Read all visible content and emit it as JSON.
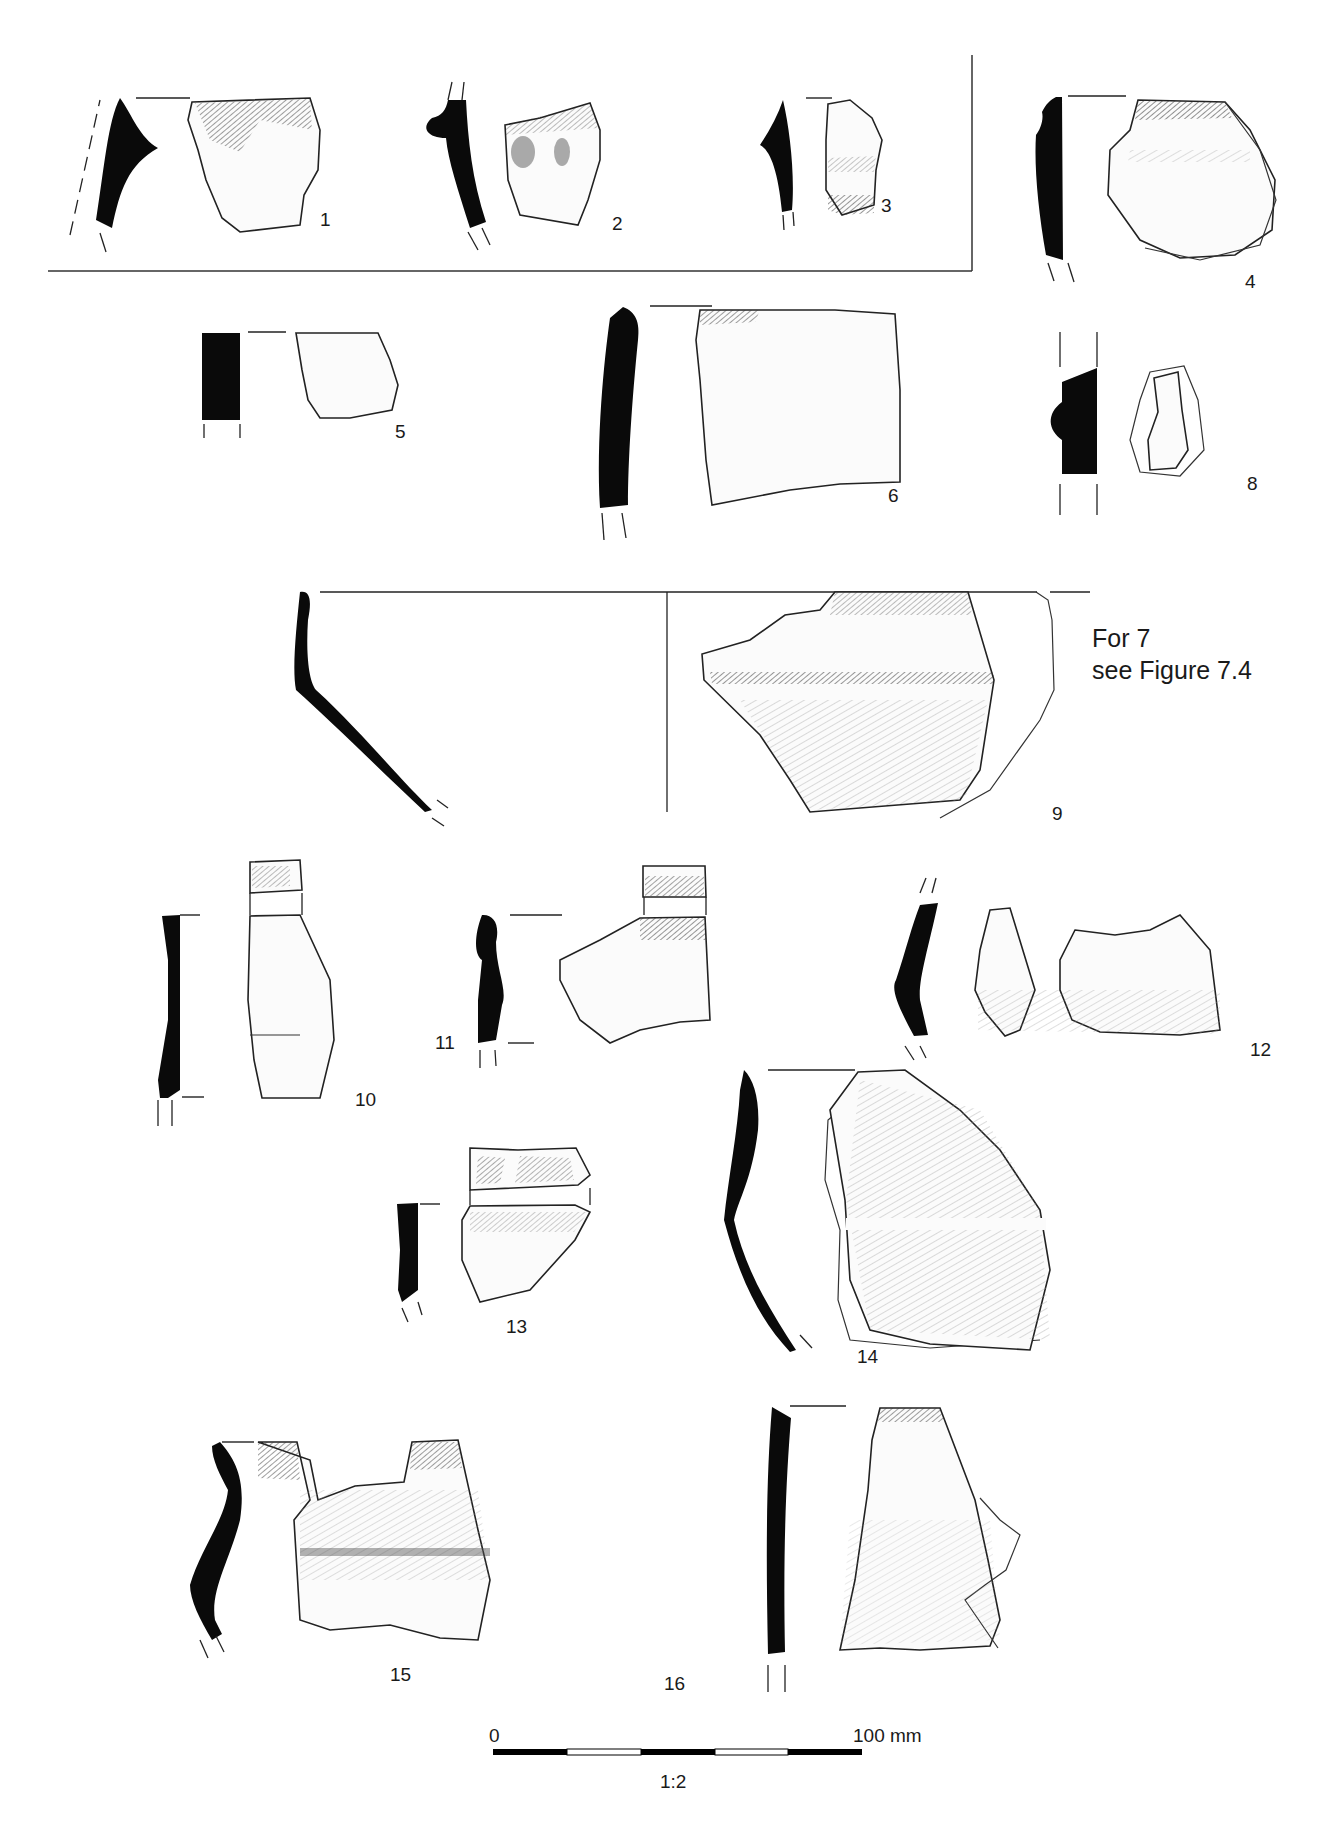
{
  "figure": {
    "type": "pottery-illustration-plate",
    "fragments": [
      {
        "id": "1",
        "label": "1",
        "group": "boxed"
      },
      {
        "id": "2",
        "label": "2",
        "group": "boxed"
      },
      {
        "id": "3",
        "label": "3",
        "group": "boxed"
      },
      {
        "id": "4",
        "label": "4"
      },
      {
        "id": "5",
        "label": "5"
      },
      {
        "id": "6",
        "label": "6"
      },
      {
        "id": "8",
        "label": "8"
      },
      {
        "id": "9",
        "label": "9"
      },
      {
        "id": "10",
        "label": "10"
      },
      {
        "id": "11",
        "label": "11"
      },
      {
        "id": "12",
        "label": "12"
      },
      {
        "id": "13",
        "label": "13"
      },
      {
        "id": "14",
        "label": "14"
      },
      {
        "id": "15",
        "label": "15"
      },
      {
        "id": "16",
        "label": "16"
      }
    ],
    "cross_reference": {
      "line1": "For 7",
      "line2": "see Figure 7.4"
    },
    "scale_bar": {
      "start_label": "0",
      "end_label": "100 mm",
      "ratio": "1:2",
      "segments": 5,
      "colors": [
        "#000000",
        "#ffffff",
        "#000000",
        "#ffffff",
        "#000000"
      ]
    }
  }
}
